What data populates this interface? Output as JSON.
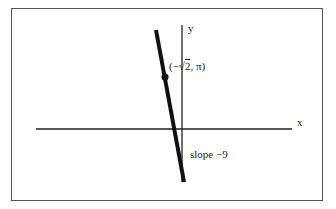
{
  "diagram": {
    "axes": {
      "x_label": "x",
      "y_label": "y"
    },
    "point": {
      "label_prefix": "(−√",
      "label_radicand": "2",
      "label_suffix": ", π)"
    },
    "line": {
      "annotation": "slope −9"
    },
    "colors": {
      "line": "#111111",
      "axis": "#222222",
      "frame": "#555555"
    }
  }
}
